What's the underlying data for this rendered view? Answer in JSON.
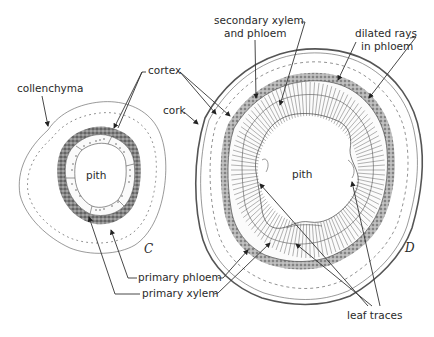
{
  "figure": {
    "panels": [
      {
        "id": "C",
        "label": "C",
        "pith_label": "pith"
      },
      {
        "id": "D",
        "label": "D",
        "pith_label": "pith"
      }
    ],
    "labels": {
      "collenchyma": "collenchyma",
      "cortex": "cortex",
      "cork": "cork",
      "secondary_xylem_line1": "secondary xylem",
      "secondary_xylem_line2": "and phloem",
      "dilated_rays_line1": "dilated rays",
      "dilated_rays_line2": "in phloem",
      "primary_phloem": "primary phloem",
      "primary_xylem": "primary xylem",
      "leaf_traces": "leaf traces"
    }
  }
}
